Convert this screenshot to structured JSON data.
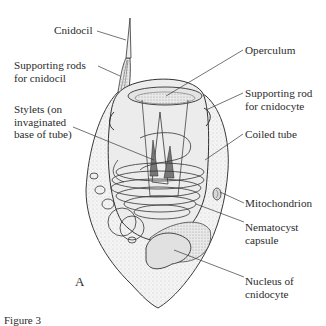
{
  "figure": {
    "panel_letter": "A",
    "caption_partial": "Figure 3"
  },
  "labels": {
    "cnidocil": "Cnidocil",
    "supporting_rods_cnidocil": "Supporting rods\nfor cnidocil",
    "stylets": "Stylets (on\ninvaginated\nbase of tube)",
    "operculum": "Operculum",
    "supporting_rod_cnidocyte": "Supporting rod\nfor cnidocyte",
    "coiled_tube": "Coiled tube",
    "mitochondrion": "Mitochondrion",
    "nematocyst_capsule": "Nematocyst\ncapsule",
    "nucleus": "Nucleus of\ncnidocyte"
  },
  "colors": {
    "ink": "#2b2b2b",
    "stipple": "#d9d9d9",
    "cell_fill": "#f1f1f1",
    "capsule_fill": "#e6e6e6",
    "nucleus_fill": "#e3e3e3"
  }
}
